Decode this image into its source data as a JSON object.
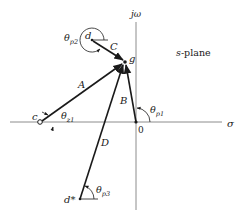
{
  "diagram": {
    "title": "s-plane",
    "axes": {
      "real_label": "σ",
      "imag_label": "jω",
      "origin_label": "0"
    },
    "points": {
      "g": {
        "label": "g",
        "type": "test-point"
      },
      "d": {
        "label": "d",
        "type": "pole"
      },
      "c": {
        "label": "c",
        "type": "zero"
      },
      "origin": {
        "label": "0",
        "type": "pole"
      },
      "d_conj": {
        "label": "d*",
        "type": "pole"
      }
    },
    "vectors": {
      "A": "A",
      "B": "B",
      "C": "C",
      "D": "D"
    },
    "angles": {
      "theta_p2": {
        "main": "θ",
        "sub": "p2"
      },
      "theta_z1": {
        "main": "θ",
        "sub": "z1"
      },
      "theta_p1": {
        "main": "θ",
        "sub": "p1"
      },
      "theta_p3": {
        "main": "θ",
        "sub": "p3"
      }
    },
    "colors": {
      "line": "#1a1a1a",
      "axis": "#8c8c8c"
    }
  }
}
